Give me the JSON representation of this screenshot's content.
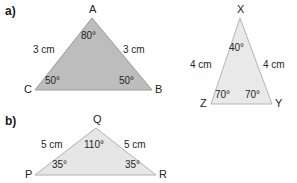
{
  "page": {
    "width": 297,
    "height": 183,
    "background": "#ffffff"
  },
  "parts": {
    "a_label": "a)",
    "b_label": "b)"
  },
  "figures": [
    {
      "id": "triangle-abc",
      "part": "a)",
      "fill": "#bdbdbd",
      "stroke": "#9a9a9a",
      "vertices": [
        {
          "name": "A",
          "label": "A",
          "x": 92,
          "y": 18
        },
        {
          "name": "B",
          "label": "B",
          "x": 152,
          "y": 90
        },
        {
          "name": "C",
          "label": "C",
          "x": 35,
          "y": 90
        }
      ],
      "angles": [
        {
          "at": "A",
          "label": "80°"
        },
        {
          "at": "B",
          "label": "50°"
        },
        {
          "at": "C",
          "label": "50°"
        }
      ],
      "sides": [
        {
          "between": "AC",
          "label": "3 cm"
        },
        {
          "between": "AB",
          "label": "3 cm"
        }
      ]
    },
    {
      "id": "triangle-xyz",
      "part": "a)",
      "fill": "#e9e9e9",
      "stroke": "#b5b5b5",
      "vertices": [
        {
          "name": "X",
          "label": "X",
          "x": 240,
          "y": 18
        },
        {
          "name": "Y",
          "label": "Y",
          "x": 272,
          "y": 104
        },
        {
          "name": "Z",
          "label": "Z",
          "x": 211,
          "y": 104
        }
      ],
      "angles": [
        {
          "at": "X",
          "label": "40°"
        },
        {
          "at": "Y",
          "label": "70°"
        },
        {
          "at": "Z",
          "label": "70°"
        }
      ],
      "sides": [
        {
          "between": "XZ",
          "label": "4 cm"
        },
        {
          "between": "XY",
          "label": "4 cm"
        }
      ]
    },
    {
      "id": "triangle-pqr",
      "part": "b)",
      "fill": "#e6e6e6",
      "stroke": "#b0b0b0",
      "vertices": [
        {
          "name": "Q",
          "label": "Q",
          "x": 96,
          "y": 128
        },
        {
          "name": "R",
          "label": "R",
          "x": 156,
          "y": 175
        },
        {
          "name": "P",
          "label": "P",
          "x": 35,
          "y": 175
        }
      ],
      "angles": [
        {
          "at": "Q",
          "label": "110°"
        },
        {
          "at": "R",
          "label": "35°"
        },
        {
          "at": "P",
          "label": "35°"
        }
      ],
      "sides": [
        {
          "between": "PQ",
          "label": "5 cm"
        },
        {
          "between": "QR",
          "label": "5 cm"
        }
      ]
    }
  ],
  "labels": {
    "abc": {
      "vertexA": "A",
      "vertexB": "B",
      "vertexC": "C",
      "angleA": "80°",
      "angleB": "50°",
      "angleC": "50°",
      "sideLeft": "3 cm",
      "sideRight": "3 cm"
    },
    "xyz": {
      "vertexX": "X",
      "vertexY": "Y",
      "vertexZ": "Z",
      "angleX": "40°",
      "angleY": "70°",
      "angleZ": "70°",
      "sideLeft": "4 cm",
      "sideRight": "4 cm"
    },
    "pqr": {
      "vertexP": "P",
      "vertexQ": "Q",
      "vertexR": "R",
      "angleP": "35°",
      "angleQ": "110°",
      "angleR": "35°",
      "sideLeft": "5 cm",
      "sideRight": "5 cm"
    }
  }
}
